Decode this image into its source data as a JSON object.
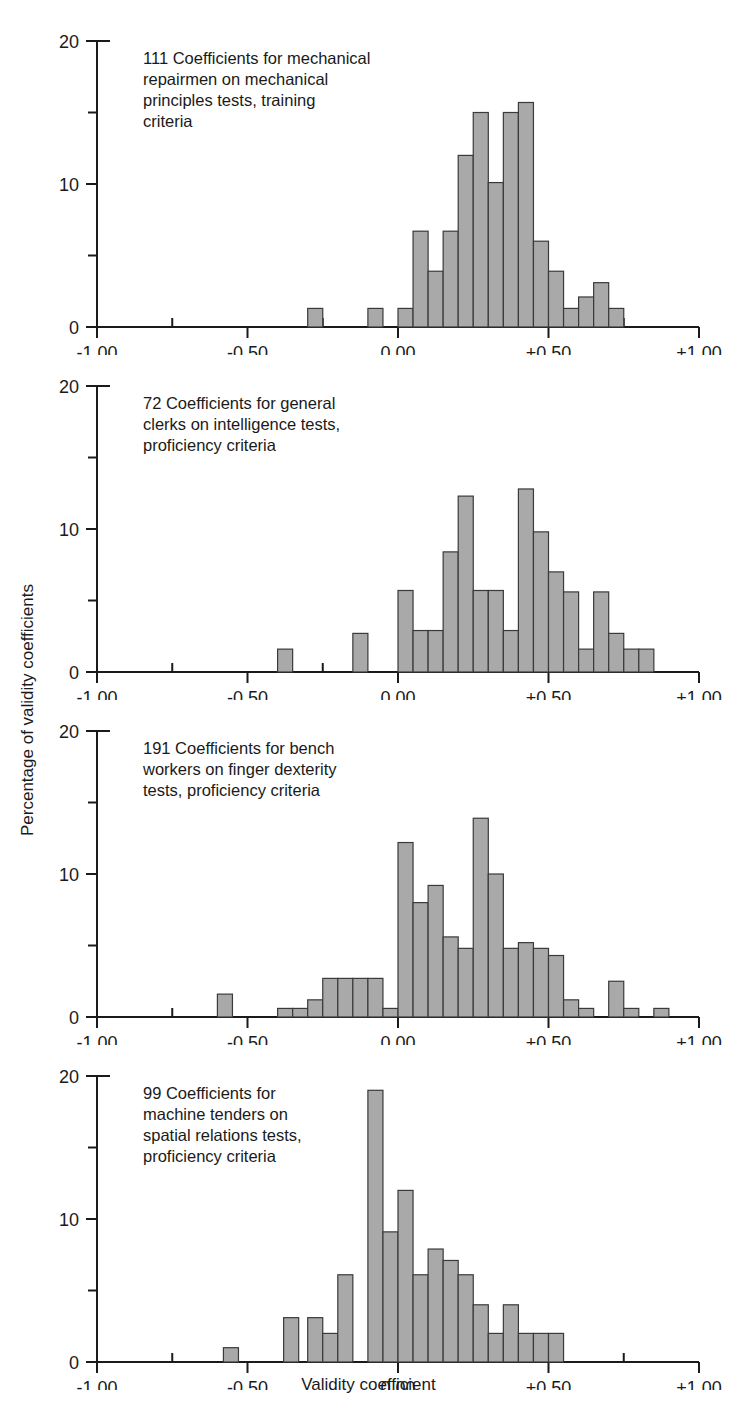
{
  "figure": {
    "ylabel": "Percentage of validity coefficients",
    "xlabel": "Validity coefficient",
    "bar_fill": "#a9a9a9",
    "bar_stroke": "#3a3a3a",
    "axis_color": "#1a1a1a",
    "background": "#ffffff"
  },
  "axes": {
    "x_ticks_major": [
      "-1.00",
      "-0.50",
      "0.00",
      "+0.50",
      "+1.00"
    ],
    "x_tick_values": [
      -1.0,
      -0.5,
      0.0,
      0.5,
      1.0
    ],
    "x_minor_values": [
      -0.75,
      -0.25,
      0.25,
      0.75
    ],
    "xlim": [
      -1.0,
      1.0
    ],
    "y_ticks_major": [
      "0",
      "10",
      "20"
    ],
    "y_tick_values": [
      0,
      10,
      20
    ],
    "y_minor_values": [
      5,
      15
    ],
    "ylim": [
      0,
      20
    ],
    "grid": false
  },
  "chart_data": [
    {
      "type": "bar",
      "id": "panel-1",
      "title": "111 Coefficients for mechanical repairmen on mechanical principles tests, training criteria",
      "caption_lines": [
        "111 Coefficients for mechanical",
        "repairmen on mechanical",
        "principles tests, training",
        "criteria"
      ],
      "n_coefficients": 111,
      "xlabel": "Validity coefficient",
      "ylabel": "Percentage of validity coefficients",
      "xlim": [
        -1.0,
        1.0
      ],
      "ylim": [
        0,
        20
      ],
      "bin_width": 0.05,
      "bins": [
        -0.3,
        -0.1,
        0.0,
        0.05,
        0.1,
        0.15,
        0.2,
        0.25,
        0.3,
        0.35,
        0.4,
        0.45,
        0.5,
        0.55,
        0.6,
        0.65,
        0.7,
        0.75
      ],
      "values": [
        1.3,
        1.3,
        1.3,
        6.7,
        3.9,
        6.7,
        12.0,
        15.0,
        10.1,
        15.0,
        15.7,
        6.0,
        3.9,
        1.3,
        2.1,
        3.1,
        1.3,
        0.0
      ]
    },
    {
      "type": "bar",
      "id": "panel-2",
      "title": "72 Coefficients for general clerks on intelligence tests, proficiency criteria",
      "caption_lines": [
        "72 Coefficients for general",
        "clerks on intelligence tests,",
        "proficiency criteria"
      ],
      "n_coefficients": 72,
      "xlabel": "Validity coefficient",
      "ylabel": "Percentage of validity coefficients",
      "xlim": [
        -1.0,
        1.0
      ],
      "ylim": [
        0,
        20
      ],
      "bin_width": 0.05,
      "bins": [
        -0.4,
        -0.15,
        0.0,
        0.05,
        0.1,
        0.15,
        0.2,
        0.25,
        0.3,
        0.35,
        0.4,
        0.45,
        0.5,
        0.55,
        0.6,
        0.65,
        0.7,
        0.75,
        0.8
      ],
      "values": [
        1.6,
        2.7,
        5.7,
        2.9,
        2.9,
        8.4,
        12.3,
        5.7,
        5.7,
        2.9,
        12.8,
        9.8,
        7.0,
        5.6,
        1.6,
        5.6,
        2.7,
        1.6,
        1.6
      ]
    },
    {
      "type": "bar",
      "id": "panel-3",
      "title": "191 Coefficients for bench workers on finger dexterity tests, proficiency criteria",
      "caption_lines": [
        "191 Coefficients for bench",
        "workers on finger dexterity",
        "tests, proficiency criteria"
      ],
      "n_coefficients": 191,
      "xlabel": "Validity coefficient",
      "ylabel": "Percentage of validity coefficients",
      "xlim": [
        -1.0,
        1.0
      ],
      "ylim": [
        0,
        20
      ],
      "bin_width": 0.05,
      "bins": [
        -0.6,
        -0.4,
        -0.35,
        -0.3,
        -0.25,
        -0.2,
        -0.15,
        -0.1,
        -0.05,
        0.0,
        0.05,
        0.1,
        0.15,
        0.2,
        0.25,
        0.3,
        0.35,
        0.4,
        0.45,
        0.5,
        0.55,
        0.6,
        0.7,
        0.75,
        0.85
      ],
      "values": [
        1.6,
        0.6,
        0.6,
        1.2,
        2.7,
        2.7,
        2.7,
        2.7,
        0.6,
        12.2,
        8.0,
        9.2,
        5.6,
        4.8,
        13.9,
        10.0,
        4.8,
        5.2,
        4.8,
        4.3,
        1.2,
        0.6,
        2.5,
        0.6,
        0.6
      ]
    },
    {
      "type": "bar",
      "id": "panel-4",
      "title": "99 Coefficients for machine tenders on spatial relations tests, proficiency criteria",
      "caption_lines": [
        "99 Coefficients for",
        "machine tenders on",
        "spatial relations tests,",
        "proficiency criteria"
      ],
      "n_coefficients": 99,
      "xlabel": "Validity coefficient",
      "ylabel": "Percentage of validity coefficients",
      "xlim": [
        -1.0,
        1.0
      ],
      "ylim": [
        0,
        20
      ],
      "bin_width": 0.05,
      "bins": [
        -0.58,
        -0.38,
        -0.3,
        -0.25,
        -0.2,
        -0.1,
        -0.05,
        0.0,
        0.05,
        0.1,
        0.15,
        0.2,
        0.25,
        0.3,
        0.35,
        0.4,
        0.45,
        0.5
      ],
      "values": [
        1.0,
        3.1,
        3.1,
        2.0,
        6.1,
        19.0,
        9.1,
        12.0,
        6.1,
        7.9,
        7.1,
        6.1,
        4.0,
        2.0,
        4.0,
        2.0,
        2.0,
        2.0
      ]
    }
  ]
}
